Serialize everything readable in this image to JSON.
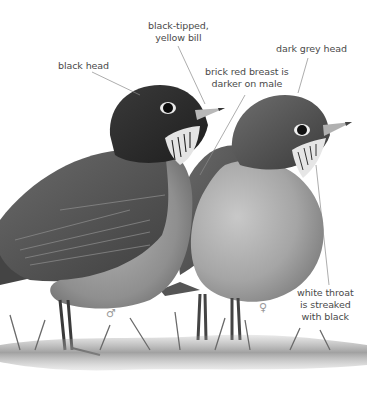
{
  "illustration": {
    "subject": "two robins, male and female",
    "style": "grayscale pencil illustration on white",
    "colors": {
      "background": "#ffffff",
      "label_text": "#4a4a4a",
      "leader_line": "#8a8a8a",
      "male_head": "#2a2a2a",
      "female_head": "#4d4d4d",
      "breast": "#9a9a9a",
      "wing": "#5a5a5a",
      "grass": "#7a7a7a"
    }
  },
  "labels": {
    "black_head": "black head",
    "bill_line1": "black-tipped,",
    "bill_line2": "yellow bill",
    "dark_grey_head": "dark grey head",
    "breast_line1": "brick red breast is",
    "breast_line2": "darker on male",
    "throat_line1": "white throat",
    "throat_line2": "is streaked",
    "throat_line3": "with black"
  },
  "sex_symbols": {
    "male": "♂",
    "female": "♀"
  }
}
